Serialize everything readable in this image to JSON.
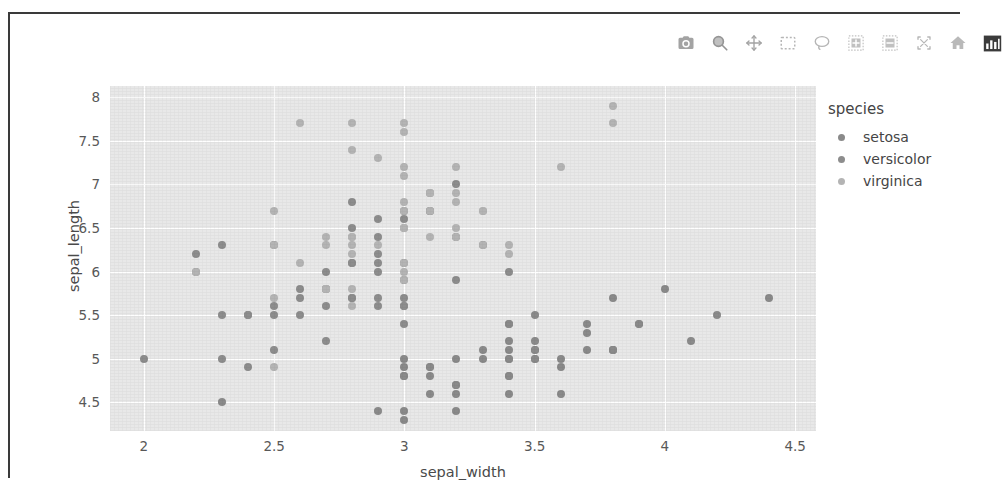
{
  "modebar": {
    "buttons": [
      {
        "name": "camera-icon",
        "label": "Download plot as a png",
        "active": false
      },
      {
        "name": "zoom-icon",
        "label": "Zoom",
        "active": false
      },
      {
        "name": "pan-icon",
        "label": "Pan",
        "active": false
      },
      {
        "name": "box-select-icon",
        "label": "Box Select",
        "active": false
      },
      {
        "name": "lasso-select-icon",
        "label": "Lasso Select",
        "active": false
      },
      {
        "name": "zoom-in-icon",
        "label": "Zoom in",
        "active": false
      },
      {
        "name": "zoom-out-icon",
        "label": "Zoom out",
        "active": false
      },
      {
        "name": "autoscale-icon",
        "label": "Autoscale",
        "active": false
      },
      {
        "name": "reset-axes-icon",
        "label": "Reset axes",
        "active": false
      },
      {
        "name": "plotly-logo-icon",
        "label": "Produced with Plotly",
        "active": true
      }
    ]
  },
  "axes": {
    "x": {
      "label": "sepal_width",
      "ticks": [
        "2",
        "2.5",
        "3",
        "3.5",
        "4",
        "4.5"
      ],
      "tickvals": [
        2,
        2.5,
        3,
        3.5,
        4,
        4.5
      ],
      "range": [
        1.87,
        4.58
      ]
    },
    "y": {
      "label": "sepal_length",
      "ticks": [
        "4.5",
        "5",
        "5.5",
        "6",
        "6.5",
        "7",
        "7.5",
        "8"
      ],
      "tickvals": [
        4.5,
        5,
        5.5,
        6,
        6.5,
        7,
        7.5,
        8
      ],
      "range": [
        4.17,
        8.13
      ]
    }
  },
  "legend": {
    "title": "species",
    "items": [
      {
        "label": "setosa",
        "color": "#8a8a8a"
      },
      {
        "label": "versicolor",
        "color": "#8d8d8d"
      },
      {
        "label": "virginica",
        "color": "#b4b4b4"
      }
    ]
  },
  "colors": {
    "plot_background": "#e8e8e8",
    "gridline": "#ffffff",
    "paper_background": "#ffffff",
    "frame_border": "#3a3a3a",
    "tick_text": "#585858",
    "axis_title": "#4a4a4a"
  },
  "chart_data": {
    "type": "scatter",
    "title": "",
    "xlabel": "sepal_width",
    "ylabel": "sepal_length",
    "xlim": [
      1.87,
      4.58
    ],
    "ylim": [
      4.17,
      8.13
    ],
    "grid": true,
    "legend_position": "right",
    "legend_title": "species",
    "series": [
      {
        "name": "setosa",
        "color": "#8a8a8a",
        "x": [
          3.5,
          3.0,
          3.2,
          3.1,
          3.6,
          3.9,
          3.4,
          3.4,
          2.9,
          3.1,
          3.7,
          3.4,
          3.0,
          3.0,
          4.0,
          4.4,
          3.9,
          3.5,
          3.8,
          3.8,
          3.4,
          3.7,
          3.6,
          3.3,
          3.4,
          3.0,
          3.4,
          3.5,
          3.4,
          3.2,
          3.1,
          3.4,
          4.1,
          4.2,
          3.1,
          3.2,
          3.5,
          3.6,
          3.0,
          3.4,
          3.5,
          2.3,
          3.2,
          3.5,
          3.8,
          3.0,
          3.8,
          3.2,
          3.7,
          3.3
        ],
        "y": [
          5.1,
          4.9,
          4.7,
          4.6,
          5.0,
          5.4,
          4.6,
          5.0,
          4.4,
          4.9,
          5.4,
          4.8,
          4.8,
          4.3,
          5.8,
          5.7,
          5.4,
          5.1,
          5.7,
          5.1,
          5.4,
          5.1,
          4.6,
          5.1,
          4.8,
          5.0,
          5.0,
          5.2,
          5.2,
          4.7,
          4.8,
          5.4,
          5.2,
          5.5,
          4.9,
          5.0,
          5.5,
          4.9,
          4.4,
          5.1,
          5.0,
          4.5,
          4.4,
          5.0,
          5.1,
          4.8,
          5.1,
          4.6,
          5.3,
          5.0
        ]
      },
      {
        "name": "versicolor",
        "color": "#8d8d8d",
        "x": [
          3.2,
          3.2,
          3.1,
          2.3,
          2.8,
          2.8,
          3.3,
          2.4,
          2.9,
          2.7,
          2.0,
          3.0,
          2.2,
          2.9,
          2.9,
          3.1,
          3.0,
          2.7,
          2.2,
          2.5,
          3.2,
          2.8,
          2.5,
          2.8,
          2.9,
          3.0,
          2.8,
          3.0,
          2.9,
          2.6,
          2.4,
          2.4,
          2.7,
          2.7,
          3.0,
          3.4,
          3.1,
          2.3,
          3.0,
          2.5,
          2.6,
          3.0,
          2.6,
          2.3,
          2.7,
          3.0,
          2.9,
          2.9,
          2.5,
          2.8
        ],
        "y": [
          7.0,
          6.4,
          6.9,
          5.5,
          6.5,
          5.7,
          6.3,
          4.9,
          6.6,
          5.2,
          5.0,
          5.9,
          6.0,
          6.1,
          5.6,
          6.7,
          5.6,
          5.8,
          6.2,
          5.6,
          5.9,
          6.1,
          6.3,
          6.1,
          6.4,
          6.6,
          6.8,
          6.7,
          6.0,
          5.7,
          5.5,
          5.5,
          5.8,
          6.0,
          5.4,
          6.0,
          6.7,
          6.3,
          5.6,
          5.5,
          5.5,
          6.1,
          5.8,
          5.0,
          5.6,
          5.7,
          5.7,
          6.2,
          5.1,
          5.7
        ]
      },
      {
        "name": "virginica",
        "color": "#b4b4b4",
        "x": [
          3.3,
          2.7,
          3.0,
          2.9,
          3.0,
          3.0,
          2.5,
          2.9,
          2.5,
          3.6,
          3.2,
          2.7,
          3.0,
          2.5,
          2.8,
          3.2,
          3.0,
          3.8,
          2.6,
          2.2,
          3.2,
          2.8,
          2.8,
          2.7,
          3.3,
          3.2,
          2.8,
          3.0,
          2.8,
          3.0,
          2.8,
          3.8,
          2.8,
          2.8,
          2.6,
          3.0,
          3.4,
          3.1,
          3.0,
          3.1,
          3.1,
          3.1,
          2.7,
          3.2,
          3.3,
          3.0,
          2.5,
          3.0,
          3.4,
          3.0
        ],
        "y": [
          6.3,
          5.8,
          7.1,
          6.3,
          6.5,
          7.6,
          4.9,
          7.3,
          6.7,
          7.2,
          6.5,
          6.4,
          6.8,
          5.7,
          5.8,
          6.4,
          6.5,
          7.7,
          7.7,
          6.0,
          6.9,
          5.6,
          7.7,
          6.3,
          6.7,
          7.2,
          6.2,
          6.1,
          6.4,
          7.2,
          7.4,
          7.9,
          6.4,
          6.3,
          6.1,
          7.7,
          6.3,
          6.4,
          6.0,
          6.9,
          6.7,
          6.9,
          5.8,
          6.8,
          6.7,
          6.7,
          6.3,
          6.5,
          6.2,
          5.9
        ]
      }
    ]
  }
}
